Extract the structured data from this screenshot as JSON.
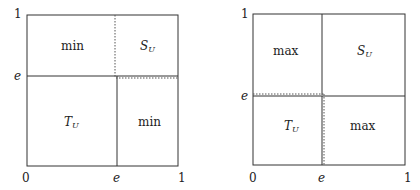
{
  "diagrams": [
    {
      "name": "left-diagram",
      "axis": {
        "x_ticks": [
          "0",
          "e",
          "1"
        ],
        "y_ticks": [
          "e",
          "1"
        ]
      },
      "regions": {
        "top_left": "min",
        "top_right": {
          "base": "S",
          "sub": "U"
        },
        "bottom_left": {
          "base": "T",
          "sub": "U"
        },
        "bottom_right": "min"
      }
    },
    {
      "name": "right-diagram",
      "axis": {
        "x_ticks": [
          "0",
          "e",
          "1"
        ],
        "y_ticks": [
          "e",
          "1"
        ]
      },
      "regions": {
        "top_left": "max",
        "top_right": {
          "base": "S",
          "sub": "U"
        },
        "bottom_left": {
          "base": "T",
          "sub": "U"
        },
        "bottom_right": "max"
      }
    }
  ],
  "colors": {
    "line": "#333333",
    "dotted": "#555555"
  }
}
